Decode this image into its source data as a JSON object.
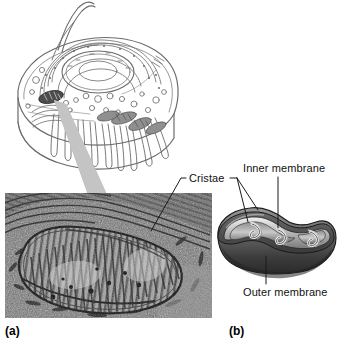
{
  "figure": {
    "type": "biology-figure",
    "background_color": "#ffffff",
    "width": 342,
    "height": 345
  },
  "panels": [
    {
      "id": "a",
      "label": "(a)",
      "caption_label": "(a)",
      "content": "electron micrograph of a mitochondrion within a cell, with line drawing of a eukaryotic cell above and a tapering arrow pointing from the cell's mitochondrion down into the micrograph"
    },
    {
      "id": "b",
      "label": "(b)",
      "caption_label": "(b)",
      "content": "three-dimensional cutaway diagram of a mitochondrion showing outer membrane, inner membrane and cristae"
    }
  ],
  "panel_labels": {
    "a": "(a)",
    "b": "(b)"
  },
  "labels": [
    {
      "name": "cristae",
      "text": "Cristae"
    },
    {
      "name": "inner-membrane",
      "text": "Inner membrane"
    },
    {
      "name": "outer-membrane",
      "text": "Outer membrane"
    }
  ],
  "label_text": {
    "cristae": "Cristae",
    "inner_membrane": "Inner membrane",
    "outer_membrane": "Outer membrane"
  },
  "colors": {
    "background": "#ffffff",
    "text": "#111111",
    "leader_line": "#1a1a1a",
    "arrow_fill": "#b9b9b9",
    "micrograph_dark": "#3a3a3a",
    "micrograph_mid": "#777777",
    "micrograph_light": "#c9c9c9",
    "mito_outer_membrane": "#4a4a4a",
    "mito_inner_membrane": "#8e8e8e",
    "mito_matrix": "#d8d8d8",
    "cell_line": "#6b6b6b"
  },
  "icons": {
    "arrow": "magnification-arrow-icon",
    "cristae_leader": "leader-line-icon",
    "inner_leader": "leader-line-icon",
    "outer_leader": "leader-line-icon"
  }
}
